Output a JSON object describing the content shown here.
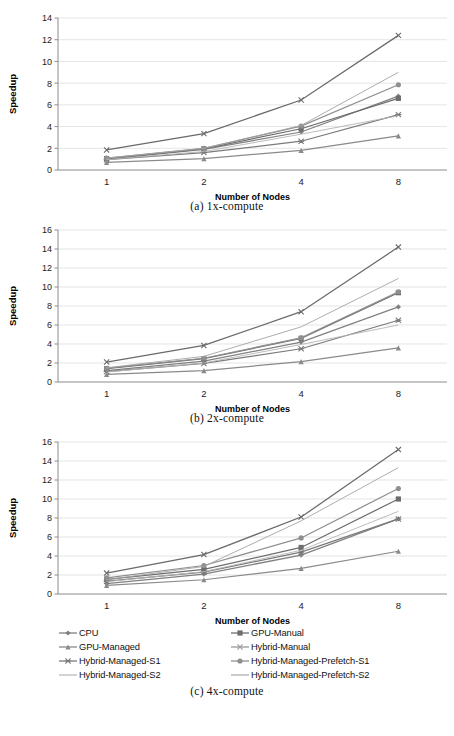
{
  "figure": {
    "axis_title_y": "Speedup",
    "axis_title_x": "Number of Nodes",
    "captions": [
      "(a) 1x-compute",
      "(b) 2x-compute",
      "(c) 4x-compute"
    ]
  },
  "legend": {
    "position": "bottom",
    "entries": [
      {
        "label": "CPU",
        "marker": "diamond-marker",
        "color": "#808080"
      },
      {
        "label": "GPU-Manual",
        "marker": "square-marker",
        "color": "#6d6d6d"
      },
      {
        "label": "GPU-Managed",
        "marker": "triangle-marker",
        "color": "#8a8a8a"
      },
      {
        "label": "Hybrid-Manual",
        "marker": "cross-marker",
        "color": "#9a9a9a"
      },
      {
        "label": "Hybrid-Managed-S1",
        "marker": "asterisk-marker",
        "color": "#7a7a7a"
      },
      {
        "label": "Hybrid-Managed-Prefetch-S1",
        "marker": "circle-marker",
        "color": "#8f8f8f"
      },
      {
        "label": "Hybrid-Managed-S2",
        "marker": "line-marker",
        "color": "#b0b0b0"
      },
      {
        "label": "Hybrid-Managed-Prefetch-S2",
        "marker": "line-marker",
        "color": "#a0a0a0"
      }
    ]
  },
  "chart_data": [
    {
      "type": "line",
      "title": "(a) 1x-compute",
      "xlabel": "Number of Nodes",
      "ylabel": "Speedup",
      "categories": [
        "1",
        "2",
        "4",
        "8"
      ],
      "ylim": [
        0,
        14
      ],
      "yticks": [
        0,
        2,
        4,
        6,
        8,
        10,
        12,
        14
      ],
      "grid": true,
      "series": [
        {
          "name": "CPU",
          "marker": "diamond",
          "color": "#808080",
          "values": [
            1.0,
            1.9,
            3.5,
            6.8
          ]
        },
        {
          "name": "GPU-Manual",
          "marker": "square",
          "color": "#6d6d6d",
          "values": [
            1.05,
            1.95,
            3.8,
            6.6
          ]
        },
        {
          "name": "GPU-Managed",
          "marker": "triangle",
          "color": "#8a8a8a",
          "values": [
            0.7,
            1.05,
            1.8,
            3.15
          ]
        },
        {
          "name": "Hybrid-Manual",
          "marker": "cross",
          "color": "#6a6a6a",
          "values": [
            1.85,
            3.35,
            6.45,
            12.4
          ]
        },
        {
          "name": "Hybrid-Managed-S1",
          "marker": "asterisk",
          "color": "#7a7a7a",
          "values": [
            0.95,
            1.6,
            2.65,
            5.1
          ]
        },
        {
          "name": "Hybrid-Managed-Prefetch-S1",
          "marker": "circle",
          "color": "#8f8f8f",
          "values": [
            1.1,
            2.0,
            4.05,
            7.85
          ]
        },
        {
          "name": "Hybrid-Managed-S2",
          "marker": "line",
          "color": "#b4b4b4",
          "values": [
            0.95,
            1.7,
            3.3,
            5.0
          ]
        },
        {
          "name": "Hybrid-Managed-Prefetch-S2",
          "marker": "line",
          "color": "#a4a4a4",
          "values": [
            1.1,
            2.0,
            4.1,
            9.0
          ]
        }
      ]
    },
    {
      "type": "line",
      "title": "(b) 2x-compute",
      "xlabel": "Number of Nodes",
      "ylabel": "Speedup",
      "categories": [
        "1",
        "2",
        "4",
        "8"
      ],
      "ylim": [
        0,
        16
      ],
      "yticks": [
        0,
        2,
        4,
        6,
        8,
        10,
        12,
        14,
        16
      ],
      "grid": true,
      "series": [
        {
          "name": "CPU",
          "marker": "diamond",
          "color": "#808080",
          "values": [
            1.2,
            2.2,
            4.2,
            7.9
          ]
        },
        {
          "name": "GPU-Manual",
          "marker": "square",
          "color": "#6d6d6d",
          "values": [
            1.4,
            2.45,
            4.6,
            9.4
          ]
        },
        {
          "name": "GPU-Managed",
          "marker": "triangle",
          "color": "#8a8a8a",
          "values": [
            0.8,
            1.2,
            2.15,
            3.6
          ]
        },
        {
          "name": "Hybrid-Manual",
          "marker": "cross",
          "color": "#6a6a6a",
          "values": [
            2.1,
            3.85,
            7.4,
            14.2
          ]
        },
        {
          "name": "Hybrid-Managed-S1",
          "marker": "asterisk",
          "color": "#7a7a7a",
          "values": [
            1.1,
            1.95,
            3.5,
            6.5
          ]
        },
        {
          "name": "Hybrid-Managed-Prefetch-S1",
          "marker": "circle",
          "color": "#8f8f8f",
          "values": [
            1.45,
            2.5,
            4.65,
            9.5
          ]
        },
        {
          "name": "Hybrid-Managed-S2",
          "marker": "line",
          "color": "#b4b4b4",
          "values": [
            1.05,
            2.0,
            3.95,
            6.0
          ]
        },
        {
          "name": "Hybrid-Managed-Prefetch-S2",
          "marker": "line",
          "color": "#a4a4a4",
          "values": [
            1.5,
            2.7,
            5.8,
            10.9
          ]
        }
      ]
    },
    {
      "type": "line",
      "title": "(c) 4x-compute",
      "xlabel": "Number of Nodes",
      "ylabel": "Speedup",
      "categories": [
        "1",
        "2",
        "4",
        "8"
      ],
      "ylim": [
        0,
        16
      ],
      "yticks": [
        0,
        2,
        4,
        6,
        8,
        10,
        12,
        14,
        16
      ],
      "grid": true,
      "series": [
        {
          "name": "CPU",
          "marker": "diamond",
          "color": "#808080",
          "values": [
            1.1,
            2.1,
            4.1,
            7.9
          ]
        },
        {
          "name": "GPU-Manual",
          "marker": "square",
          "color": "#6d6d6d",
          "values": [
            1.55,
            2.6,
            4.9,
            10.0
          ]
        },
        {
          "name": "GPU-Managed",
          "marker": "triangle",
          "color": "#8a8a8a",
          "values": [
            0.9,
            1.5,
            2.7,
            4.5
          ]
        },
        {
          "name": "Hybrid-Manual",
          "marker": "cross",
          "color": "#6a6a6a",
          "values": [
            2.2,
            4.15,
            8.1,
            15.2
          ]
        },
        {
          "name": "Hybrid-Managed-S1",
          "marker": "asterisk",
          "color": "#7a7a7a",
          "values": [
            1.35,
            2.3,
            4.4,
            7.9
          ]
        },
        {
          "name": "Hybrid-Managed-Prefetch-S1",
          "marker": "circle",
          "color": "#8f8f8f",
          "values": [
            1.7,
            3.0,
            5.9,
            11.1
          ]
        },
        {
          "name": "Hybrid-Managed-S2",
          "marker": "line",
          "color": "#b4b4b4",
          "values": [
            1.3,
            2.35,
            4.6,
            8.7
          ]
        },
        {
          "name": "Hybrid-Managed-Prefetch-S2",
          "marker": "line",
          "color": "#a4a4a4",
          "values": [
            1.5,
            2.9,
            7.7,
            13.3
          ]
        }
      ]
    }
  ]
}
